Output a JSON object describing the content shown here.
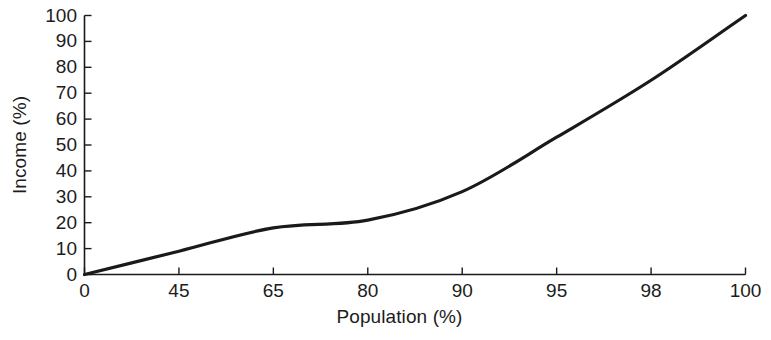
{
  "chart_data": {
    "type": "line",
    "title": "",
    "subtitle": "",
    "xlabel": "Population (%)",
    "ylabel": "Income (%)",
    "x_tick_labels": [
      "0",
      "45",
      "65",
      "80",
      "90",
      "95",
      "98",
      "100"
    ],
    "x_tick_values": [
      0,
      45,
      65,
      80,
      90,
      95,
      98,
      100
    ],
    "x_axis_scale": "categorical-uneven",
    "y_tick_labels": [
      "0",
      "10",
      "20",
      "30",
      "40",
      "50",
      "60",
      "70",
      "80",
      "90",
      "100"
    ],
    "y_tick_values": [
      0,
      10,
      20,
      30,
      40,
      50,
      60,
      70,
      80,
      90,
      100
    ],
    "xlim": [
      0,
      100
    ],
    "ylim": [
      0,
      100
    ],
    "grid": false,
    "legend": false,
    "legend_position": "none",
    "series": [
      {
        "name": "Income distribution",
        "color": "#1a1a1a",
        "line_width": 3.2,
        "x": [
          0,
          45,
          65,
          80,
          90,
          95,
          98,
          100
        ],
        "values": [
          0,
          9,
          18,
          21,
          32,
          53,
          75,
          100
        ]
      }
    ],
    "annotations": []
  },
  "axes": {
    "x_title": "Population (%)",
    "y_title": "Income (%)",
    "axis_color": "#1a1a1a",
    "tick_direction": "in"
  }
}
